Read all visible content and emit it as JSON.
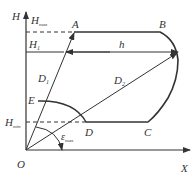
{
  "diagram": {
    "axes": {
      "y_label": "H",
      "x_label": "X",
      "origin_label": "O"
    },
    "levels": {
      "h_max": {
        "label": "H",
        "subscript": "max"
      },
      "h_1": {
        "label": "H",
        "subscript": "1"
      },
      "h_min": {
        "label": "H",
        "subscript": "min"
      }
    },
    "points": {
      "A": "A",
      "B": "B",
      "C": "C",
      "D": "D",
      "E": "E"
    },
    "distances": {
      "d1": {
        "label": "D",
        "subscript": "1"
      },
      "d2": {
        "label": "D",
        "subscript": "2"
      },
      "h": "h"
    },
    "angle": {
      "label": "ε",
      "subscript": "max"
    },
    "colors": {
      "line": "#333333",
      "background": "#ffffff"
    }
  }
}
